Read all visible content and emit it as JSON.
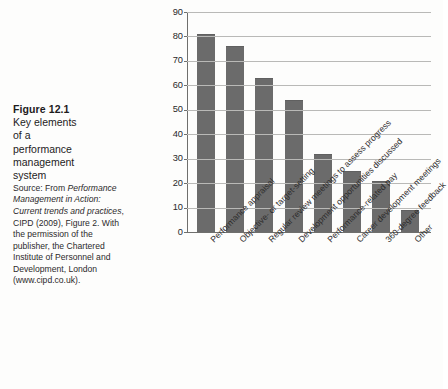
{
  "figure": {
    "title": "Figure 12.1",
    "subtitle_lines": [
      "Key elements",
      "of a",
      "performance",
      "management",
      "system"
    ],
    "source_prefix": "Source: From ",
    "source_italic": "Performance Management in Action: Current trends and practices",
    "source_suffix": ", CIPD (2009), Figure 2. With the permission of the publisher, the Chartered Institute of Personnel and Development, London (www.cipd.co.uk)."
  },
  "colors": {
    "bar_fill": "#6b6b6b",
    "gridline": "#b9b9b7",
    "axis": "#6f6f6d",
    "page_background": "#fdfdfc",
    "text": "#231f20"
  },
  "chart_data": {
    "type": "bar",
    "title": "",
    "xlabel": "",
    "ylabel": "",
    "ylim": [
      0,
      90
    ],
    "ytick_step": 10,
    "yticks": [
      90,
      80,
      70,
      60,
      50,
      40,
      30,
      20,
      10,
      0
    ],
    "grid": true,
    "legend": "none",
    "orientation": "vertical",
    "categories": [
      "Performance appraisal",
      "Objective- or target-setting",
      "Regular review meetings to assess progress",
      "Development opportunities discussed",
      "Performance-related pay",
      "Career development meetings",
      "360-degree feedback",
      "Other"
    ],
    "values": [
      81,
      76,
      63,
      54,
      32,
      25,
      21,
      9
    ]
  }
}
